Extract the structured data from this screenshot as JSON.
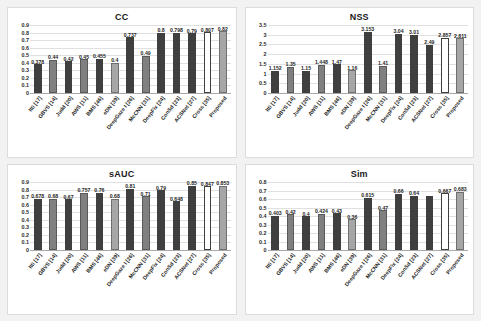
{
  "figure": {
    "background": "#f2f2f2",
    "panel_background": "#ffffff"
  },
  "colors": {
    "dark_bar": "#3f3f3f",
    "mid_bar": "#808080",
    "light_bar": "#a6a6a6",
    "outline_bar": "#ffffff",
    "outline_stroke": "#404040",
    "gridline": "#e0e0e0",
    "axis": "#a8a8a8",
    "text": "#1f1f1f"
  },
  "categories": [
    "Itti [17]",
    "GBVS [14]",
    "Judd [20]",
    "AWS [11]",
    "BMS [46]",
    "eDN [39]",
    "DeepGaze I [26]",
    "McCNN [31]",
    "DeepFix [24]",
    "ConSd [23]",
    "ACSNet [27]",
    "Cross [35]",
    "Proposed"
  ],
  "bar_styles": [
    "dark",
    "mid",
    "dark",
    "mid",
    "dark",
    "light",
    "dark",
    "mid",
    "dark",
    "dark",
    "dark",
    "outline",
    "light"
  ],
  "chart_data": [
    {
      "type": "bar",
      "title": "CC",
      "xlabel": "",
      "ylabel": "",
      "ylim": [
        0,
        0.9
      ],
      "yticks": [
        "0",
        "0.1",
        "0.2",
        "0.3",
        "0.4",
        "0.5",
        "0.6",
        "0.7",
        "0.8",
        "0.9"
      ],
      "grid": true,
      "legend": "none",
      "categories": [
        "Itti [17]",
        "GBVS [14]",
        "Judd [20]",
        "AWS [11]",
        "BMS [46]",
        "eDN [39]",
        "DeepGaze I [26]",
        "McCNN [31]",
        "DeepFix [24]",
        "ConSd [23]",
        "ACSNet [27]",
        "Cross [35]",
        "Proposed"
      ],
      "values": [
        0.378,
        0.44,
        0.42,
        0.45,
        0.455,
        0.4,
        0.737,
        0.49,
        0.8,
        0.798,
        0.79,
        0.807,
        0.82
      ],
      "value_labels": [
        "0.378",
        "0.44",
        "0.42",
        "0.45",
        "0.455",
        "0.4",
        "0.737",
        "0.49",
        "0.8",
        "0.798",
        "0.79",
        "0.807",
        "0.82"
      ]
    },
    {
      "type": "bar",
      "title": "NSS",
      "xlabel": "",
      "ylabel": "",
      "ylim": [
        0,
        3.5
      ],
      "yticks": [
        "0",
        "0.5",
        "1",
        "1.5",
        "2",
        "2.5",
        "3",
        "3.5"
      ],
      "grid": true,
      "legend": "none",
      "categories": [
        "Itti [17]",
        "GBVS [14]",
        "Judd [20]",
        "AWS [11]",
        "BMS [46]",
        "eDN [39]",
        "DeepGaze I [26]",
        "McCNN [31]",
        "DeepFix [24]",
        "ConSd [23]",
        "ACSNet [27]",
        "Cross [35]",
        "Proposed"
      ],
      "values": [
        1.152,
        1.35,
        1.15,
        1.448,
        1.47,
        1.16,
        3.153,
        1.41,
        3.04,
        3.01,
        2.49,
        2.857,
        2.811
      ],
      "value_labels": [
        "1.152",
        "1.35",
        "1.15",
        "1.448",
        "1.47",
        "1.16",
        "3.153",
        "1.41",
        "3.04",
        "3.01",
        "2.49",
        "2.857",
        "2.811"
      ]
    },
    {
      "type": "bar",
      "title": "sAUC",
      "xlabel": "",
      "ylabel": "",
      "ylim": [
        0,
        0.9
      ],
      "yticks": [
        "0",
        "0.1",
        "0.2",
        "0.3",
        "0.4",
        "0.5",
        "0.6",
        "0.7",
        "0.8",
        "0.9"
      ],
      "grid": true,
      "legend": "none",
      "categories": [
        "Itti [17]",
        "GBVS [14]",
        "Judd [20]",
        "AWS [11]",
        "BMS [46]",
        "eDN [39]",
        "DeepGaze I [26]",
        "McCNN [31]",
        "DeepFix [24]",
        "ConSd [23]",
        "ACSNet [27]",
        "Cross [35]",
        "Proposed"
      ],
      "values": [
        0.678,
        0.68,
        0.67,
        0.757,
        0.76,
        0.68,
        0.81,
        0.71,
        0.79,
        0.648,
        0.85,
        0.847,
        0.853
      ],
      "value_labels": [
        "0.678",
        "0.68",
        "0.67",
        "0.757",
        "0.76",
        "0.68",
        "0.81",
        "0.71",
        "0.79",
        "0.648",
        "0.85",
        "0.847",
        "0.853"
      ]
    },
    {
      "type": "bar",
      "title": "Sim",
      "xlabel": "",
      "ylabel": "",
      "ylim": [
        0,
        0.8
      ],
      "yticks": [
        "0",
        "0.1",
        "0.2",
        "0.3",
        "0.4",
        "0.5",
        "0.6",
        "0.7",
        "0.8"
      ],
      "grid": true,
      "legend": "none",
      "categories": [
        "Itti [17]",
        "GBVS [14]",
        "Judd [20]",
        "AWS [11]",
        "BMS [46]",
        "eDN [39]",
        "DeepGaze I [26]",
        "McCNN [31]",
        "DeepFix [24]",
        "ConSd [23]",
        "ACSNet [27]",
        "Cross [35]",
        "Proposed"
      ],
      "values": [
        0.403,
        0.42,
        0.4,
        0.424,
        0.43,
        0.36,
        0.615,
        0.47,
        0.66,
        0.64,
        0.64,
        0.667,
        0.683
      ],
      "value_labels": [
        "0.403",
        "0.42",
        "0.4",
        "0.424",
        "0.43",
        "0.36",
        "0.615",
        "0.47",
        "0.66",
        "0.64",
        "",
        "0.667",
        "0.683"
      ]
    }
  ]
}
